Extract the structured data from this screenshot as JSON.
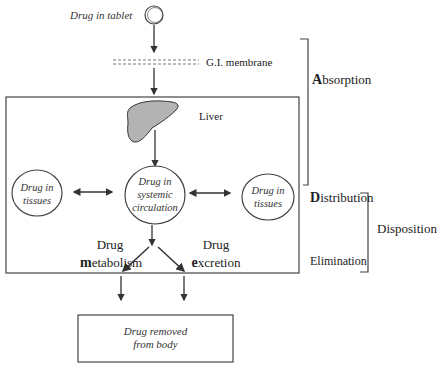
{
  "tablet": {
    "label": "Drug in tablet"
  },
  "membrane": {
    "label": "G.I. membrane"
  },
  "liver": {
    "label": "Liver"
  },
  "nodes": {
    "left_tissue": {
      "line1": "Drug in",
      "line2": "tissues"
    },
    "circulation": {
      "line1": "Drug in",
      "line2": "systemic",
      "line3": "circulation"
    },
    "right_tissue": {
      "line1": "Drug in",
      "line2": "tissues"
    },
    "removed": {
      "line1": "Drug removed",
      "line2": "from body"
    }
  },
  "processes": {
    "metabolism": {
      "line1": "Drug",
      "initial": "m",
      "rest": "etabolism"
    },
    "excretion": {
      "line1": "Drug",
      "initial": "e",
      "rest": "xcretion"
    }
  },
  "phases": {
    "absorption": {
      "initial": "A",
      "rest": "bsorption"
    },
    "distribution": {
      "initial": "D",
      "rest": "istribution"
    },
    "elimination": {
      "label": "Elimination"
    },
    "disposition": {
      "label": "Disposition"
    }
  },
  "colors": {
    "line": "#333333",
    "liver_fill": "#b3b3b3",
    "background": "#ffffff"
  }
}
